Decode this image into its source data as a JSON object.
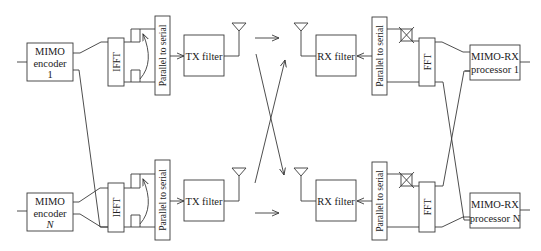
{
  "diagram": {
    "colors": {
      "stroke": "#3a3a3a",
      "text": "#222222",
      "background": "#ffffff"
    },
    "transmitter": {
      "encoders": [
        {
          "line1": "MIMO",
          "line2": "encoder",
          "line3": "1"
        },
        {
          "line1": "MIMO",
          "line2": "encoder",
          "line3": "N"
        }
      ],
      "ifft_label": "IFFT",
      "p2s_label": "Parallel to serial",
      "tx_filter_label": "TX filter"
    },
    "receiver": {
      "rx_filter_label": "RX filter",
      "p2s_label": "Parallel to serial",
      "fft_label": "FFT",
      "processors": [
        {
          "line1": "MIMO-RX",
          "line2": "processor 1"
        },
        {
          "line1": "MIMO-RX",
          "line2": "processor N"
        }
      ]
    },
    "icons": {
      "tx_antenna": "antenna-icon",
      "rx_antenna": "antenna-icon",
      "cp_removal": "crossed-box-icon",
      "cp_insertion": "arc-arrow-icon"
    }
  }
}
